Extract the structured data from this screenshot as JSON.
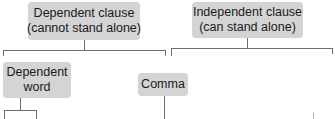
{
  "diagram": {
    "type": "tree",
    "nodes": {
      "dependent_clause": {
        "line1": "Dependent clause",
        "line2": "(cannot stand alone)"
      },
      "independent_clause": {
        "line1": "Independent clause",
        "line2": "(can stand alone)"
      },
      "dependent_word": {
        "line1": "Dependent",
        "line2": "word"
      },
      "comma": {
        "line1": "Comma"
      }
    },
    "edges": [
      {
        "from": "dependent_clause",
        "to": "dependent_word"
      },
      {
        "from": "dependent_clause",
        "to": "comma"
      },
      {
        "from": "independent_clause",
        "to": "children (cut off)"
      }
    ],
    "colors": {
      "node_fill": "#d4d4d4",
      "line": "#6e6e6e",
      "background": "#ffffff"
    }
  }
}
